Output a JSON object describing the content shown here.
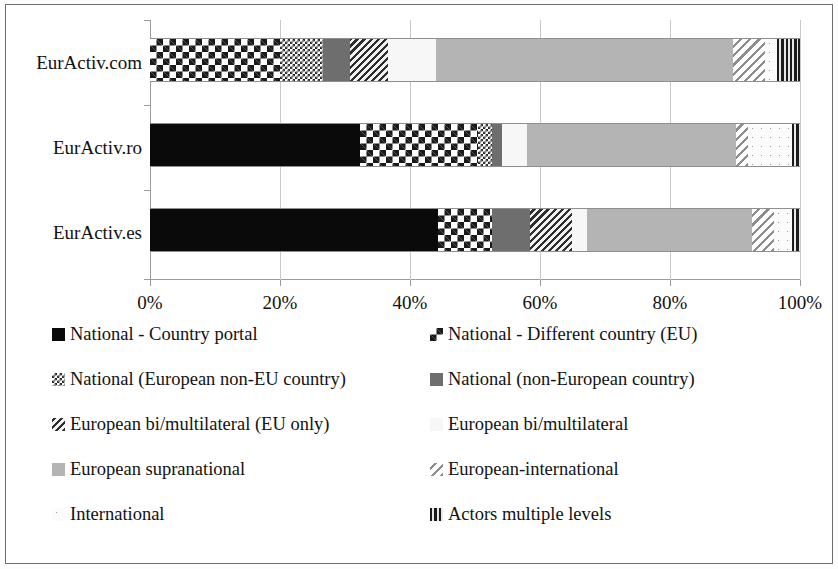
{
  "chart_data": {
    "type": "bar",
    "orientation": "horizontal",
    "stacked": true,
    "normalized": true,
    "title": "",
    "xlabel": "",
    "ylabel": "",
    "xlim": [
      0,
      100
    ],
    "grid": true,
    "legend_position": "bottom",
    "categories": [
      "EurActiv.com",
      "EurActiv.ro",
      "EurActiv.es"
    ],
    "xtick_labels": [
      "0%",
      "20%",
      "40%",
      "60%",
      "80%",
      "100%"
    ],
    "xtick_values": [
      0,
      20,
      40,
      60,
      80,
      100
    ],
    "series": [
      {
        "name": "National - Country portal",
        "pattern": "solid-black",
        "color": "#0a0a0a",
        "values": [
          0.0,
          32.3,
          44.3
        ]
      },
      {
        "name": "National - Different country (EU)",
        "pattern": "checkerboard",
        "color": "#1a1a1a",
        "values": [
          20.0,
          18.2,
          8.3
        ]
      },
      {
        "name": "National (European non-EU country)",
        "pattern": "fine-dot",
        "color": "#2b2b2b",
        "values": [
          6.6,
          2.1,
          0.0
        ]
      },
      {
        "name": "National (non-European country)",
        "pattern": "solid-dark-grey",
        "color": "#6e6e6e",
        "values": [
          4.2,
          1.6,
          5.9
        ]
      },
      {
        "name": "European bi/multilateral (EU only)",
        "pattern": "diagonal-dark",
        "color": "#2e2e2e",
        "values": [
          5.8,
          0.0,
          6.4
        ]
      },
      {
        "name": "European bi/multilateral",
        "pattern": "near-white",
        "color": "#f7f7f7",
        "values": [
          7.4,
          3.8,
          2.3
        ]
      },
      {
        "name": "European supranational",
        "pattern": "solid-light-grey",
        "color": "#b4b4b4",
        "values": [
          45.7,
          32.2,
          25.4
        ]
      },
      {
        "name": "European-international",
        "pattern": "diagonal-light",
        "color": "#8d8d8d",
        "values": [
          4.9,
          1.8,
          3.4
        ]
      },
      {
        "name": "International",
        "pattern": "dotted-white",
        "color": "#fbfbfb",
        "values": [
          1.9,
          6.8,
          2.8
        ]
      },
      {
        "name": "Actors multiple levels",
        "pattern": "vertical-stripe",
        "color": "#1c1c1c",
        "values": [
          3.5,
          1.2,
          1.2
        ]
      }
    ]
  },
  "legend": {
    "items": [
      {
        "label": "National - Country portal",
        "pattern": "p-solid-black"
      },
      {
        "label": "National - Different country (EU)",
        "pattern": "p-checker"
      },
      {
        "label": "National (European non-EU country)",
        "pattern": "p-finedot"
      },
      {
        "label": "National (non-European country)",
        "pattern": "p-darkgrey"
      },
      {
        "label": "European bi/multilateral (EU only)",
        "pattern": "p-diag-dark"
      },
      {
        "label": "European bi/multilateral",
        "pattern": "p-white"
      },
      {
        "label": "European supranational",
        "pattern": "p-lightgrey"
      },
      {
        "label": "European-international",
        "pattern": "p-diag-light"
      },
      {
        "label": "International",
        "pattern": "p-dotted-white"
      },
      {
        "label": "Actors multiple levels",
        "pattern": "p-vstripe"
      }
    ]
  }
}
